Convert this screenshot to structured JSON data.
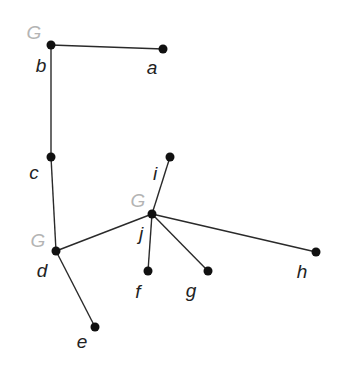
{
  "diagram": {
    "type": "tree",
    "colors": {
      "edge": "#2a2a2a",
      "node": "#111111",
      "label": "#222222",
      "marker": "#b4b4b4"
    },
    "nodes": [
      {
        "id": "a",
        "label": "a",
        "x": 163,
        "y": 49,
        "lx": 152,
        "ly": 67
      },
      {
        "id": "b",
        "label": "b",
        "x": 51,
        "y": 45,
        "lx": 41,
        "ly": 65
      },
      {
        "id": "c",
        "label": "c",
        "x": 51,
        "y": 157,
        "lx": 34,
        "ly": 172
      },
      {
        "id": "d",
        "label": "d",
        "x": 56,
        "y": 251,
        "lx": 42,
        "ly": 270
      },
      {
        "id": "e",
        "label": "e",
        "x": 95,
        "y": 327,
        "lx": 82,
        "ly": 341
      },
      {
        "id": "f",
        "label": "f",
        "x": 148,
        "y": 271,
        "lx": 138,
        "ly": 291
      },
      {
        "id": "g",
        "label": "g",
        "x": 208,
        "y": 271,
        "lx": 191,
        "ly": 290
      },
      {
        "id": "h",
        "label": "h",
        "x": 316,
        "y": 252,
        "lx": 302,
        "ly": 271
      },
      {
        "id": "i",
        "label": "i",
        "x": 170,
        "y": 157,
        "lx": 155,
        "ly": 173
      },
      {
        "id": "j",
        "label": "j",
        "x": 152,
        "y": 214,
        "lx": 141,
        "ly": 233
      }
    ],
    "edges": [
      [
        "b",
        "a"
      ],
      [
        "b",
        "c"
      ],
      [
        "c",
        "d"
      ],
      [
        "d",
        "e"
      ],
      [
        "d",
        "j"
      ],
      [
        "j",
        "i"
      ],
      [
        "j",
        "f"
      ],
      [
        "j",
        "g"
      ],
      [
        "j",
        "h"
      ]
    ],
    "markers": [
      {
        "text": "G",
        "node": "b",
        "x": 34,
        "y": 32
      },
      {
        "text": "G",
        "node": "d",
        "x": 38,
        "y": 240
      },
      {
        "text": "G",
        "node": "j",
        "x": 138,
        "y": 200
      }
    ]
  }
}
